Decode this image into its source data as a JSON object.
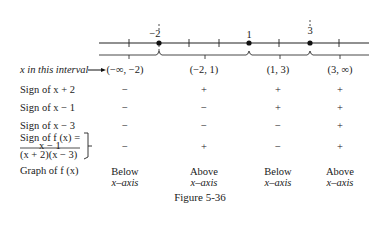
{
  "figure": {
    "caption": "Figure 5-36",
    "number_line": {
      "critical_points": [
        {
          "label": "−2",
          "value": -2
        },
        {
          "label": "1",
          "value": 1
        },
        {
          "label": "3",
          "value": 3
        }
      ]
    },
    "row_labels": {
      "interval": "x in this interval",
      "sign_x_plus_2": "Sign of x + 2",
      "sign_x_minus_1": "Sign of x − 1",
      "sign_x_minus_3": "Sign of x − 3",
      "sign_f_line1": "Sign of f (x) =",
      "sign_f_numerator": "x − 1",
      "sign_f_denominator": "(x + 2)(x − 3)",
      "graph": "Graph of f (x)"
    },
    "columns": [
      {
        "interval": "(−∞, −2)",
        "x_plus_2": "−",
        "x_minus_1": "−",
        "x_minus_3": "−",
        "f": "−",
        "graph_line1": "Below",
        "graph_line2": "x–axis"
      },
      {
        "interval": "(−2, 1)",
        "x_plus_2": "+",
        "x_minus_1": "−",
        "x_minus_3": "−",
        "f": "+",
        "graph_line1": "Above",
        "graph_line2": "x–axis"
      },
      {
        "interval": "(1, 3)",
        "x_plus_2": "+",
        "x_minus_1": "+",
        "x_minus_3": "−",
        "f": "−",
        "graph_line1": "Below",
        "graph_line2": "x–axis"
      },
      {
        "interval": "(3, ∞)",
        "x_plus_2": "+",
        "x_minus_1": "+",
        "x_minus_3": "+",
        "f": "+",
        "graph_line1": "Above",
        "graph_line2": "x–axis"
      }
    ]
  }
}
